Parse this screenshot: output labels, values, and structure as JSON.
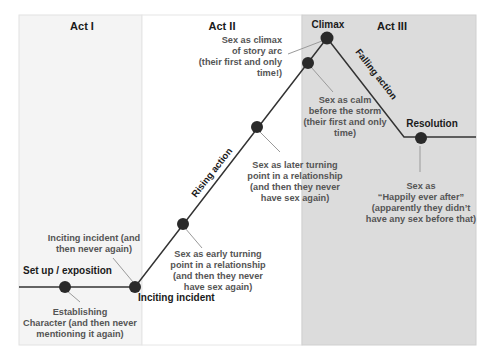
{
  "colors": {
    "act1_bg": "#f4f4f4",
    "act2_bg": "#ffffff",
    "act3_bg": "#dcdcdc",
    "line": "#333333",
    "dot": "#2a2a2a",
    "leader": "#9a9a9a"
  },
  "acts": [
    {
      "label": "Act I"
    },
    {
      "label": "Act II"
    },
    {
      "label": "Act III"
    }
  ],
  "stages": {
    "setup": "Set up / exposition",
    "inciting": "Inciting incident",
    "rising": "Rising action",
    "climax": "Climax",
    "falling": "Falling action",
    "resolution": "Resolution"
  },
  "annotations": {
    "establishing": [
      "Establishing",
      "Character (and then never",
      "mentioning it again)"
    ],
    "inciting": [
      "Inciting incident (and",
      "then never again)"
    ],
    "early_turning": [
      "Sex as early turning",
      "point in a relationship",
      "(and then they never",
      "have sex again)"
    ],
    "later_turning": [
      "Sex as later turning",
      "point in a relationship",
      "(and then they never",
      "have sex again)"
    ],
    "climax": [
      "Sex as climax",
      "of story arc",
      "(their first and only",
      "time!)"
    ],
    "calm": [
      "Sex as calm",
      "before the storm",
      "(their first and only",
      "time)"
    ],
    "resolution": [
      "Sex as",
      "“Happily ever after”",
      "(apparently they didn’t",
      "have any sex before that)"
    ]
  }
}
